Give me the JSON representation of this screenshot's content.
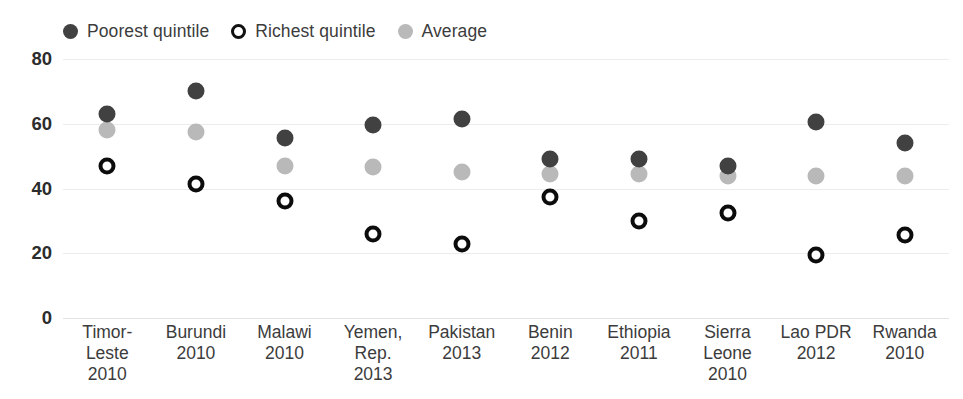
{
  "legend": {
    "items": [
      {
        "label": "Poorest quintile",
        "icon": "filled-circle-dark",
        "color": "#414141"
      },
      {
        "label": "Richest quintile",
        "icon": "open-circle-black",
        "color": "#111111"
      },
      {
        "label": "Average",
        "icon": "filled-circle-gray",
        "color": "#b9b9b9"
      }
    ]
  },
  "chart_data": {
    "type": "scatter",
    "title": "",
    "subtitle": "",
    "xlabel": "",
    "ylabel": "",
    "ylim": [
      0,
      80
    ],
    "yticks": [
      0,
      20,
      40,
      60,
      80
    ],
    "ytick_labels": [
      "0",
      "20",
      "40",
      "60",
      "80"
    ],
    "grid": true,
    "legend_position": "top-left",
    "categories": [
      "Timor-Leste 2010",
      "Burundi 2010",
      "Malawi 2010",
      "Yemen, Rep. 2013",
      "Pakistan 2013",
      "Benin 2012",
      "Ethiopia 2011",
      "Sierra Leone 2010",
      "Lao PDR 2012",
      "Rwanda 2010"
    ],
    "category_lines": [
      [
        "Timor-",
        "Leste",
        "2010"
      ],
      [
        "Burundi",
        "2010"
      ],
      [
        "Malawi",
        "2010"
      ],
      [
        "Yemen,",
        "Rep.",
        "2013"
      ],
      [
        "Pakistan",
        "2013"
      ],
      [
        "Benin",
        "2012"
      ],
      [
        "Ethiopia",
        "2011"
      ],
      [
        "Sierra",
        "Leone",
        "2010"
      ],
      [
        "Lao PDR",
        "2012"
      ],
      [
        "Rwanda",
        "2010"
      ]
    ],
    "series": [
      {
        "name": "Poorest quintile",
        "color": "#414141",
        "marker": "filled-circle",
        "values": [
          63,
          70,
          55.5,
          59.5,
          61.5,
          49,
          49,
          47,
          60.5,
          54
        ]
      },
      {
        "name": "Richest quintile",
        "color": "#0c0c0c",
        "marker": "open-circle",
        "values": [
          47,
          41.5,
          36,
          26,
          23,
          37.5,
          30,
          32.5,
          19.5,
          25.5
        ]
      },
      {
        "name": "Average",
        "color": "#b9b9b9",
        "marker": "filled-circle",
        "values": [
          58,
          57.5,
          47,
          46.5,
          45,
          44.5,
          44.5,
          44,
          44,
          44
        ]
      }
    ]
  }
}
